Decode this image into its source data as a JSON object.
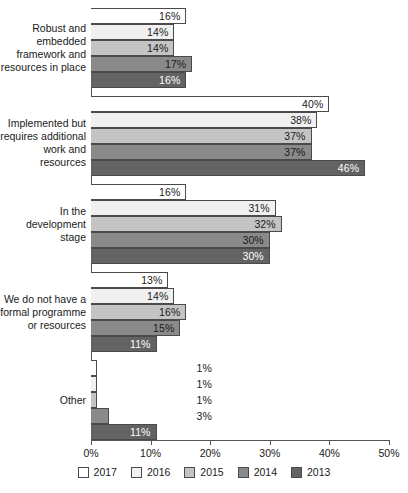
{
  "chart_data": {
    "type": "bar",
    "orientation": "horizontal",
    "title": "",
    "subtitle": "",
    "xlabel": "",
    "ylabel": "",
    "xlim": [
      0,
      50
    ],
    "xticks": [
      "0%",
      "10%",
      "20%",
      "30%",
      "40%",
      "50%"
    ],
    "xtick_values": [
      0,
      10,
      20,
      30,
      40,
      50
    ],
    "grid": false,
    "legend_position": "bottom",
    "categories": [
      "Robust and embedded framework and resources in place",
      "Implemented but requires additional work and resources",
      "In the development stage",
      "We do not have a formal programme or resources",
      "Other"
    ],
    "category_label_lines": [
      [
        "Robust and",
        "embedded",
        "framework and",
        "resources in place"
      ],
      [
        "Implemented but",
        "requires additional",
        "work and resources"
      ],
      [
        "In the",
        "development",
        "stage"
      ],
      [
        "We do not have a",
        "formal programme",
        "or resources"
      ],
      [
        "Other"
      ]
    ],
    "series": [
      {
        "name": "2017",
        "color": "#ffffff",
        "values": [
          16,
          40,
          16,
          13,
          1
        ],
        "labels": [
          "16%",
          "40%",
          "16%",
          "13%",
          "1%"
        ]
      },
      {
        "name": "2016",
        "color": "#f0f0f0",
        "values": [
          14,
          38,
          31,
          14,
          1
        ],
        "labels": [
          "14%",
          "38%",
          "31%",
          "14%",
          "1%"
        ]
      },
      {
        "name": "2015",
        "color": "#c4c4c4",
        "values": [
          14,
          37,
          32,
          16,
          1
        ],
        "labels": [
          "14%",
          "37%",
          "32%",
          "16%",
          "1%"
        ]
      },
      {
        "name": "2014",
        "color": "#8a8a8a",
        "values": [
          17,
          37,
          30,
          15,
          3
        ],
        "labels": [
          "17%",
          "37%",
          "30%",
          "15%",
          "3%"
        ]
      },
      {
        "name": "2013",
        "color": "#636363",
        "values": [
          16,
          46,
          30,
          11,
          11
        ],
        "labels": [
          "16%",
          "46%",
          "30%",
          "11%",
          "11%"
        ]
      }
    ]
  },
  "legend": {
    "items": [
      {
        "label": "2017",
        "color": "#ffffff"
      },
      {
        "label": "2016",
        "color": "#f0f0f0"
      },
      {
        "label": "2015",
        "color": "#c4c4c4"
      },
      {
        "label": "2014",
        "color": "#8a8a8a"
      },
      {
        "label": "2013",
        "color": "#636363"
      }
    ]
  },
  "axis": {
    "tick_labels": [
      "0%",
      "10%",
      "20%",
      "30%",
      "40%",
      "50%"
    ]
  },
  "colors": {
    "axis": "#555555",
    "bar_border": "#4a4a4a",
    "text": "#1a1a1a",
    "label_on_dark": "#ffffff"
  }
}
